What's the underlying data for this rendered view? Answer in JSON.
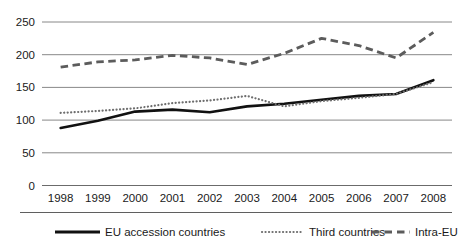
{
  "chart_data": {
    "type": "line",
    "title": "",
    "subtitle": "",
    "xlabel": "",
    "ylabel": "",
    "x": [
      1998,
      1999,
      2000,
      2001,
      2002,
      2003,
      2004,
      2005,
      2006,
      2007,
      2008
    ],
    "categories": [
      "1998",
      "1999",
      "2000",
      "2001",
      "2002",
      "2003",
      "2004",
      "2005",
      "2006",
      "2007",
      "2008"
    ],
    "y_ticks": [
      0,
      50,
      100,
      150,
      200,
      250
    ],
    "ylim": [
      0,
      250
    ],
    "grid": true,
    "legend_position": "bottom",
    "series": [
      {
        "name": "EU accession countries",
        "style": "solid",
        "color": "#111111",
        "values": [
          88,
          99,
          113,
          116,
          112,
          121,
          125,
          131,
          137,
          140,
          161
        ]
      },
      {
        "name": "Third countries",
        "style": "dotted",
        "color": "#6e6e6e",
        "values": [
          111,
          114,
          118,
          126,
          130,
          137,
          121,
          129,
          134,
          140,
          158
        ]
      },
      {
        "name": "Intra-EU",
        "style": "dashed",
        "color": "#5c5c5c",
        "values": [
          181,
          189,
          192,
          199,
          195,
          185,
          202,
          225,
          214,
          195,
          234
        ]
      }
    ]
  },
  "axis": {
    "y_labels": [
      "250",
      "200",
      "150",
      "100",
      "50",
      "0"
    ],
    "x_labels": [
      "1998",
      "1999",
      "2000",
      "2001",
      "2002",
      "2003",
      "2004",
      "2005",
      "2006",
      "2007",
      "2008"
    ]
  },
  "legend": {
    "items": [
      {
        "label": "EU accession countries",
        "marker": "solid-line-marker"
      },
      {
        "label": "Third countries",
        "marker": "dotted-line-marker"
      },
      {
        "label": "Intra-EU",
        "marker": "dashed-line-marker"
      }
    ]
  }
}
